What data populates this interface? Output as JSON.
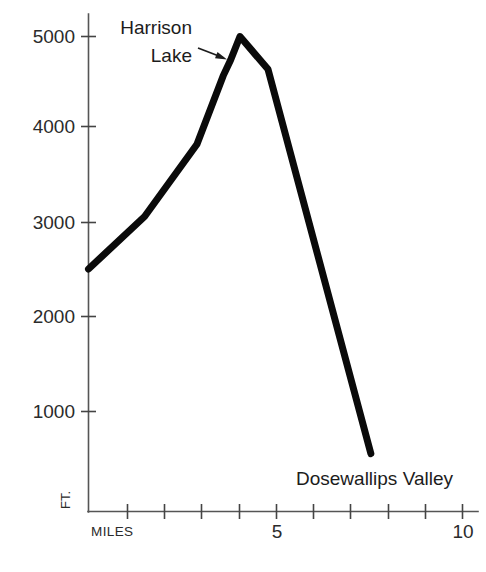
{
  "chart_data": {
    "type": "line",
    "title": "",
    "xlabel": "MILES",
    "ylabel": "FT.",
    "xlim": [
      0,
      10
    ],
    "ylim": [
      0,
      5400
    ],
    "grid": false,
    "legend": false,
    "x_tick_values": [
      1,
      2,
      3,
      4,
      5,
      6,
      7,
      8,
      9,
      10
    ],
    "x_tick_labels": [
      "",
      "",
      "",
      "",
      "5",
      "",
      "",
      "",
      "",
      "10"
    ],
    "y_tick_values": [
      1000,
      2000,
      3000,
      4000,
      5000
    ],
    "y_tick_labels": [
      "1000",
      "2000",
      "3000",
      "4000",
      "5000"
    ],
    "series": [
      {
        "name": "Trail elevation profile",
        "x": [
          0.0,
          1.5,
          2.9,
          3.6,
          3.8,
          4.05,
          4.8,
          7.55
        ],
        "y": [
          2520,
          3080,
          3850,
          4580,
          4750,
          5000,
          4650,
          550
        ]
      }
    ],
    "annotations": [
      {
        "label": "Harrison Lake",
        "lines": [
          "Harrison",
          "Lake"
        ],
        "x": 3.8,
        "y": 4750
      },
      {
        "label": "Dosewallips Valley",
        "lines": [
          "Dosewallips Valley"
        ],
        "x": 7.55,
        "y": 550
      }
    ]
  },
  "axes": {
    "y_unit_label": "FT.",
    "x_name_label": "MILES",
    "y_labels": [
      "5000",
      "4000",
      "3000",
      "2000",
      "1000"
    ],
    "x_label_5": "5",
    "x_label_10": "10"
  },
  "annotations": {
    "harrison_line1": "Harrison",
    "harrison_line2": "Lake",
    "dosewallips": "Dosewallips Valley"
  },
  "colors": {
    "profile_line": "#0a0a0a",
    "axis": "#555555",
    "text": "#2b2b2b",
    "background": "#ffffff"
  }
}
